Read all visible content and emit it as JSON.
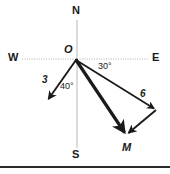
{
  "figure": {
    "background": "#ffffff",
    "axis_color": "#b9b9b9",
    "vector_color": "#1a1a1a",
    "baseline_color": "#2b2b2b",
    "width": 170,
    "height": 174
  },
  "compass": {
    "north": "N",
    "south": "S",
    "east": "E",
    "west": "W"
  },
  "points": {
    "origin": "O",
    "terminal": "M"
  },
  "magnitudes": {
    "left_vector": "3",
    "right_vector": "6"
  },
  "angles": {
    "left_angle": "40°",
    "right_angle": "30°"
  },
  "geometry": {
    "origin_x": 76,
    "origin_y": 60,
    "left_tip_x": 47,
    "left_tip_y": 101,
    "m_x": 126,
    "m_y": 135,
    "right_vertex_x": 156,
    "right_vertex_y": 110,
    "v_axis_x": 77,
    "v_axis_top": 20,
    "v_axis_bottom": 148,
    "h_axis_y": 59,
    "h_axis_left": 22,
    "h_axis_right": 148
  }
}
